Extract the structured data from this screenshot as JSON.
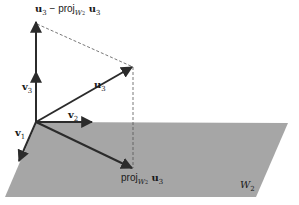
{
  "diagram": {
    "type": "vector-projection",
    "plane": {
      "label": "W",
      "label_sub": "2",
      "color": "#a6a6a6"
    },
    "vectors": [
      {
        "id": "v1",
        "label": "v",
        "sub": "1"
      },
      {
        "id": "v2",
        "label": "v",
        "sub": "2"
      },
      {
        "id": "v3",
        "label": "v",
        "sub": "3"
      },
      {
        "id": "u3",
        "label": "u",
        "sub": "3"
      }
    ],
    "labels": {
      "top": {
        "u": "u",
        "u_sub": "3",
        "minus": " − ",
        "proj": "proj",
        "w": "W",
        "w_sub": "2",
        "u2": " u",
        "u2_sub": "3"
      },
      "proj": {
        "proj": "proj",
        "w": "W",
        "w_sub": "2",
        "u": " u",
        "u_sub": "3"
      }
    },
    "colors": {
      "arrow": "#2b2b2b",
      "dashed": "#555555"
    }
  }
}
